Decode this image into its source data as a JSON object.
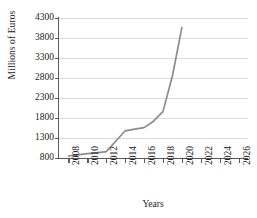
{
  "chart_data": {
    "type": "line",
    "title": "",
    "xlabel": "Years",
    "ylabel": "Millions of Euros",
    "x": [
      2008,
      2009,
      2010,
      2011,
      2012,
      2013,
      2014,
      2015,
      2016,
      2017,
      2018,
      2019,
      2020
    ],
    "values": [
      850,
      880,
      910,
      930,
      960,
      1220,
      1480,
      1520,
      1560,
      1720,
      1960,
      2850,
      4060
    ],
    "series": [
      {
        "name": "Millions of Euros",
        "values": [
          850,
          880,
          910,
          930,
          960,
          1220,
          1480,
          1520,
          1560,
          1720,
          1960,
          2850,
          4060
        ]
      }
    ],
    "xlim": [
      2007,
      2027
    ],
    "ylim": [
      800,
      4300
    ],
    "yticks": [
      800,
      1300,
      1800,
      2300,
      2800,
      3300,
      3800,
      4300
    ],
    "ytick_labels": [
      "800",
      "1300",
      "1800",
      "2300",
      "2800",
      "3300",
      "3800",
      "4300"
    ],
    "xticks": [
      2008,
      2010,
      2012,
      2014,
      2016,
      2018,
      2020,
      2022,
      2024,
      2026
    ],
    "xtick_labels": [
      "2008",
      "2010",
      "2012",
      "2014",
      "2016",
      "2018",
      "2020",
      "2022",
      "2024",
      "2026"
    ],
    "xtick_rotation": 90,
    "grid": "horizontal",
    "legend": "none",
    "line_color": "#8c8c8c",
    "grid_color": "#dcdcdc",
    "axis_color": "#5a5a5a",
    "background_color": "#ffffff"
  }
}
